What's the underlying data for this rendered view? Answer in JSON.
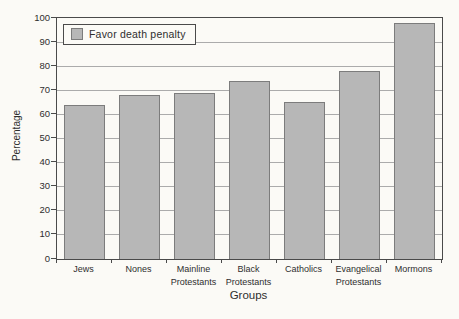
{
  "chart_data": {
    "type": "bar",
    "title": "",
    "categories": [
      "Jews",
      "Nones",
      "Mainline\nProtestants",
      "Black\nProtestants",
      "Catholics",
      "Evangelical\nProtestants",
      "Mormons"
    ],
    "values": [
      64,
      68,
      69,
      74,
      65,
      78,
      98
    ],
    "legend_label": "Favor death penalty",
    "legend_position": "top-left inside plot",
    "xlabel": "Groups",
    "ylabel": "Percentage",
    "ylim": [
      0,
      100
    ],
    "ytick_step": 10,
    "ytick_labels": [
      "0",
      "10",
      "20",
      "30",
      "40",
      "50",
      "60",
      "70",
      "80",
      "90",
      "100"
    ],
    "grid": true
  },
  "colors": {
    "bar_fill": "#b7b7b7",
    "bar_border": "#7c7c7c",
    "gridline": "#ababab",
    "axis_frame": "#4a4a4a",
    "text": "#2e2e2e",
    "background": "#fbfaf6"
  }
}
